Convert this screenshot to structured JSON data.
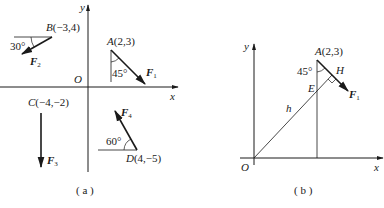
{
  "figure_a": {
    "caption": "( a )",
    "axes": {
      "x_label": "x",
      "y_label": "y",
      "origin_label": "O"
    },
    "points": {
      "A": {
        "label": "A(2,3)",
        "name": "A",
        "coords": "(2,3)"
      },
      "B": {
        "label": "B(−3,4)",
        "name": "B",
        "coords": "(−3,4)"
      },
      "C": {
        "label": "C(−4,−2)",
        "name": "C",
        "coords": "(−4,−2)"
      },
      "D": {
        "label": "D(4,−5)",
        "name": "D",
        "coords": "(4,−5)"
      }
    },
    "forces": {
      "F1": {
        "label": "F",
        "sub": "1",
        "angle": "45°",
        "reference": "vertical"
      },
      "F2": {
        "label": "F",
        "sub": "2",
        "angle": "30°",
        "reference": "horizontal"
      },
      "F3": {
        "label": "F",
        "sub": "3"
      },
      "F4": {
        "label": "F",
        "sub": "4",
        "angle": "60°",
        "reference": "horizontal"
      }
    }
  },
  "figure_b": {
    "caption": "( b )",
    "axes": {
      "x_label": "x",
      "y_label": "y",
      "origin_label": "O"
    },
    "points": {
      "A": {
        "name": "A",
        "coords": "(2,3)"
      },
      "E": {
        "name": "E"
      },
      "H": {
        "name": "H"
      }
    },
    "force": {
      "label": "F",
      "sub": "1",
      "angle": "45°"
    },
    "moment_arm_label": "h"
  }
}
